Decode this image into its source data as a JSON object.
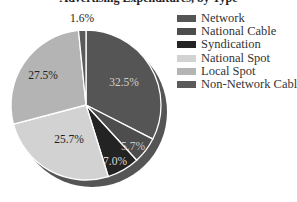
{
  "chart_data": {
    "type": "pie",
    "title": "Advertising Expenditures, by Type",
    "categories": [
      "Network",
      "National Cable",
      "Syndication",
      "National Spot",
      "Local Spot",
      "Non-Network Cable"
    ],
    "values": [
      32.5,
      5.7,
      7.0,
      25.7,
      27.5,
      1.6
    ],
    "labels": [
      "32.5%",
      "5.7%",
      "7.0%",
      "25.7%",
      "27.5%",
      "1.6%"
    ],
    "colors": [
      "#555555",
      "#4d4d4d",
      "#232323",
      "#d2d2d2",
      "#b4b4b4",
      "#5a5a5a"
    ],
    "label_colors": [
      "#cfcfcf",
      "#c8c8c8",
      "#d8d8d8",
      "#222222",
      "#222222",
      "#222222"
    ],
    "shadow_color": "#555555",
    "legend_position": "right",
    "start_angle_deg": 0,
    "direction": "clockwise"
  },
  "legend": [
    {
      "label": "Network",
      "color": "#555555"
    },
    {
      "label": "National Cable",
      "color": "#4d4d4d"
    },
    {
      "label": "Syndication",
      "color": "#232323"
    },
    {
      "label": "National Spot",
      "color": "#d2d2d2"
    },
    {
      "label": "Local Spot",
      "color": "#b4b4b4"
    },
    {
      "label": "Non-Network Cable",
      "color": "#5a5a5a"
    }
  ]
}
